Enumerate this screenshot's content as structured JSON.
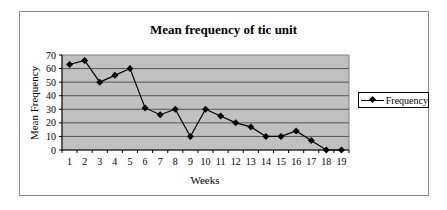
{
  "chart_data": {
    "type": "line",
    "title": "Mean frequency of tic unit",
    "xlabel": "Weeks",
    "ylabel": "Mean Frequency",
    "categories": [
      "1",
      "2",
      "3",
      "4",
      "5",
      "6",
      "7",
      "8",
      "9",
      "10",
      "11",
      "12",
      "13",
      "14",
      "15",
      "16",
      "17",
      "18",
      "19"
    ],
    "series": [
      {
        "name": "Frequency",
        "values": [
          63,
          66,
          50,
          55,
          60,
          31,
          26,
          30,
          10,
          30,
          25,
          20,
          17,
          10,
          10,
          14,
          7,
          0,
          0
        ],
        "color": "#000000",
        "marker": "diamond"
      }
    ],
    "ylim": [
      0,
      70
    ],
    "yticks": [
      0,
      10,
      20,
      30,
      40,
      50,
      60,
      70
    ],
    "grid": true,
    "plot_background": "#c0c0c0",
    "legend_position": "right"
  }
}
